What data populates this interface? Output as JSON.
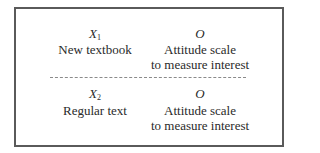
{
  "groups": [
    {
      "treatment_symbol": "X",
      "treatment_subscript": "1",
      "treatment_label": "New textbook",
      "observation_symbol": "O",
      "observation_label_line1": "Attitude scale",
      "observation_label_line2": "to measure interest"
    },
    {
      "treatment_symbol": "X",
      "treatment_subscript": "2",
      "treatment_label": "Regular text",
      "observation_symbol": "O",
      "observation_label_line1": "Attitude scale",
      "observation_label_line2": "to measure interest"
    }
  ],
  "colors": {
    "border": "#5a5a5a",
    "divider": "#8a8a8a",
    "text": "#2a2a2a"
  }
}
